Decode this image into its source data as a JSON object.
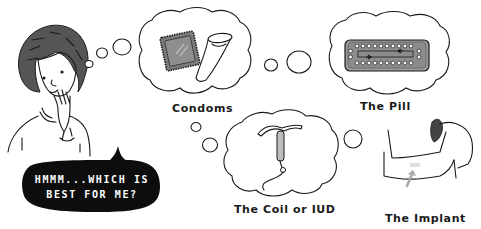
{
  "illustration": {
    "speech_bubble": {
      "line1": "HMMM...WHICH IS",
      "line2": "BEST FOR ME?"
    },
    "thoughts": [
      {
        "id": "condoms",
        "label": "Condoms"
      },
      {
        "id": "pill",
        "label": "The Pill"
      },
      {
        "id": "coil",
        "label": "The Coil or IUD"
      },
      {
        "id": "implant",
        "label": "The Implant"
      }
    ]
  },
  "colors": {
    "ink": "#1a1a1a",
    "gray_fill": "#8a8a8a",
    "light_gray": "#c8c8c8",
    "background": "#ffffff"
  }
}
